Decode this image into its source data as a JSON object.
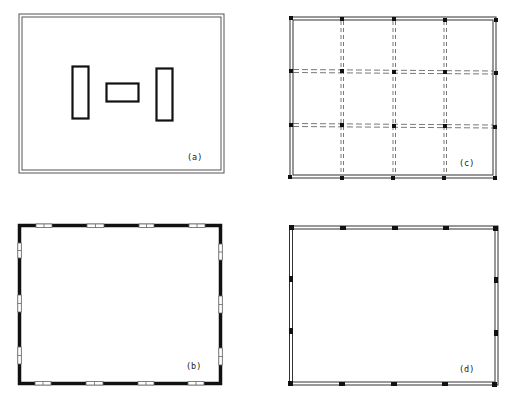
{
  "figure": {
    "panels": [
      {
        "id": "a",
        "label": "(a)",
        "description": "Double-line outer wall with three interior rectangular elements",
        "outer": {
          "x1": 19,
          "y1": 14,
          "x2": 224,
          "y2": 173
        },
        "inner_elements": [
          {
            "x": 72,
            "y": 66,
            "w": 17,
            "h": 53
          },
          {
            "x": 106,
            "y": 83,
            "w": 33,
            "h": 18
          },
          {
            "x": 156,
            "y": 68,
            "w": 16,
            "h": 53
          }
        ]
      },
      {
        "id": "b",
        "label": "(b)",
        "description": "Thick solid outer wall with window openings",
        "outer": {
          "x1": 18,
          "y1": 224,
          "x2": 221,
          "y2": 384
        },
        "windows_horizontal_x": [
          [
            36,
            52
          ],
          [
            87,
            104
          ],
          [
            139,
            154
          ],
          [
            189,
            205
          ]
        ],
        "windows_vertical_y": [
          [
            244,
            258
          ],
          [
            296,
            312
          ],
          [
            348,
            364
          ]
        ]
      },
      {
        "id": "c",
        "label": "(c)",
        "description": "Double-line outer wall with column grid and dashed beams",
        "outer": {
          "x1": 290,
          "y1": 17,
          "x2": 496,
          "y2": 178
        },
        "grid_x": [
          290,
          342,
          394,
          445,
          496
        ],
        "grid_y": [
          18,
          71,
          125,
          178
        ]
      },
      {
        "id": "d",
        "label": "(d)",
        "description": "Double-line outer wall with perimeter pillars",
        "outer": {
          "x1": 289,
          "y1": 226,
          "x2": 498,
          "y2": 385
        },
        "pillars_x": [
          291,
          343,
          395,
          446,
          496
        ],
        "pillars_y": [
          279,
          331
        ]
      }
    ],
    "colors": {
      "line": "#1a1a1a",
      "thin_line": "#555555",
      "background": "#ffffff"
    }
  }
}
